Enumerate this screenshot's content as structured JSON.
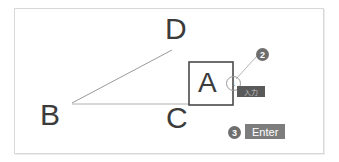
{
  "figure": {
    "background_color": "#ffffff",
    "frame_color": "#d8d8d8",
    "ink_color": "#3b3b3b",
    "line_color": "#9a9a9a",
    "badge_color": "#6e6e6e",
    "key_color": "#7d7d7d",
    "chip_color": "#5a5a5a"
  },
  "vertices": [
    {
      "id": "d",
      "label": "D"
    },
    {
      "id": "b",
      "label": "B"
    },
    {
      "id": "c",
      "label": "C"
    }
  ],
  "square": {
    "label": "A"
  },
  "steps": [
    {
      "id": "one",
      "number": "1",
      "kind": "snap-marker",
      "target": "square-right-edge-midpoint"
    },
    {
      "id": "two",
      "number": "2",
      "kind": "callout",
      "target": "input-chip"
    },
    {
      "id": "three",
      "number": "3",
      "kind": "key-press",
      "target": "enter-key"
    }
  ],
  "input_chip": {
    "value": "入力"
  },
  "key_badge": {
    "label": "Enter"
  }
}
